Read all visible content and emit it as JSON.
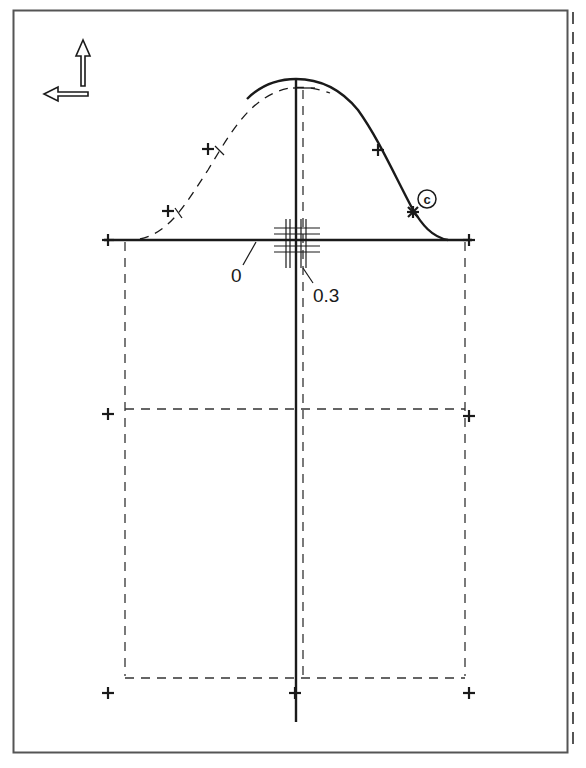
{
  "diagram": {
    "type": "sewing-pattern-sleeve-draft",
    "labels": {
      "zero": "0",
      "offset": "0.3",
      "circle_marker": "c"
    },
    "icons": {
      "grain_up": "arrow-up-icon",
      "grain_left": "arrow-left-icon"
    },
    "colors": {
      "line": "#1a1a1a",
      "frame": "#555555",
      "background": "#ffffff"
    }
  }
}
